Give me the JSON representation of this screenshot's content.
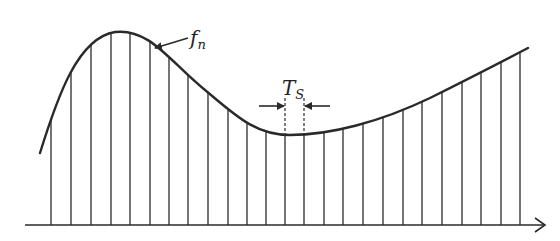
{
  "diagram": {
    "colors": {
      "ink": "#2a2a2a",
      "background": "#ffffff"
    },
    "axis": {
      "y": 225,
      "x_start": 25,
      "x_end": 545,
      "has_arrow": true
    },
    "curve": {
      "label_main": "f",
      "label_sub": "n",
      "path": "M 40 153 C 58 95, 78 38, 115 32 C 150 28, 170 62, 205 90 C 235 115, 255 135, 290 135 C 330 135, 380 122, 430 98 C 470 78, 505 60, 528 48"
    },
    "samples": {
      "x_positions": [
        51,
        71,
        91,
        111,
        130,
        150,
        169,
        188,
        208,
        228,
        247,
        266,
        285,
        304,
        324,
        343,
        363,
        383,
        403,
        422,
        442,
        462,
        481,
        501,
        520
      ]
    },
    "period_marker": {
      "label_main": "T",
      "label_sub": "S",
      "left_x": 285,
      "right_x": 304,
      "y": 106
    }
  }
}
